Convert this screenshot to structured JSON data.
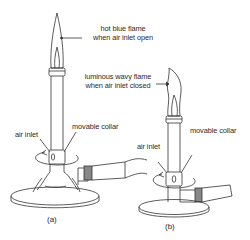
{
  "diagram": {
    "burner_a": {
      "caption": "(a)",
      "flame_label_line1": "hot blue flame",
      "flame_label_line2": "when air inlet open",
      "air_inlet_label": "air inlet",
      "collar_label": "movable collar"
    },
    "burner_b": {
      "caption": "(b)",
      "flame_label_line1": "luminous wavy flame",
      "flame_label_line2": "when air inlet closed",
      "air_inlet_label": "air inlet",
      "collar_label": "movable collar"
    },
    "colors": {
      "line": "#333333",
      "text": "#2a2a2a",
      "hose_band": "#8a8a8a"
    }
  }
}
